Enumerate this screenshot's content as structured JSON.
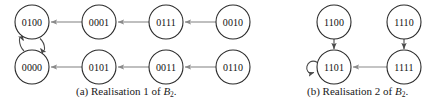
{
  "figure": {
    "background_color": "#ffffff",
    "node_stroke_color": "#2b2b2b",
    "edge_color": "#8a8a8a",
    "label_color": "#101010",
    "node_radius": 17
  },
  "panels": [
    {
      "id": "panel-a",
      "caption_prefix": "(a)",
      "caption_text": "Realisation 1 of",
      "caption_symbol": "B",
      "caption_subscript": "2",
      "caption_suffix": ".",
      "nodes": [
        {
          "id": "n0100",
          "label": "0100",
          "cx": 32,
          "cy": 22
        },
        {
          "id": "n0001",
          "label": "0001",
          "cx": 99,
          "cy": 22
        },
        {
          "id": "n0111",
          "label": "0111",
          "cx": 166,
          "cy": 22
        },
        {
          "id": "n0010",
          "label": "0010",
          "cx": 233,
          "cy": 22
        },
        {
          "id": "n0000",
          "label": "0000",
          "cx": 32,
          "cy": 67
        },
        {
          "id": "n0101",
          "label": "0101",
          "cx": 99,
          "cy": 67
        },
        {
          "id": "n0011",
          "label": "0011",
          "cx": 166,
          "cy": 67
        },
        {
          "id": "n0110",
          "label": "0110",
          "cx": 233,
          "cy": 67
        }
      ],
      "edges": [
        {
          "from": "0001",
          "to": "0100",
          "kind": "straight-left"
        },
        {
          "from": "0111",
          "to": "0001",
          "kind": "straight-left"
        },
        {
          "from": "0010",
          "to": "0111",
          "kind": "straight-left"
        },
        {
          "from": "0101",
          "to": "0000",
          "kind": "straight-left"
        },
        {
          "from": "0011",
          "to": "0101",
          "kind": "straight-left"
        },
        {
          "from": "0110",
          "to": "0011",
          "kind": "straight-left"
        },
        {
          "from": "0000",
          "to": "0100",
          "kind": "curved-up"
        },
        {
          "from": "0100",
          "to": "0000",
          "kind": "curved-down"
        }
      ]
    },
    {
      "id": "panel-b",
      "caption_prefix": "(b)",
      "caption_text": "Realisation 2 of",
      "caption_symbol": "B",
      "caption_subscript": "2",
      "caption_suffix": ".",
      "nodes": [
        {
          "id": "n1100",
          "label": "1100",
          "cx": 334,
          "cy": 22
        },
        {
          "id": "n1110",
          "label": "1110",
          "cx": 404,
          "cy": 22
        },
        {
          "id": "n1101",
          "label": "1101",
          "cx": 334,
          "cy": 67
        },
        {
          "id": "n1111",
          "label": "1111",
          "cx": 404,
          "cy": 67
        }
      ],
      "edges": [
        {
          "from": "1100",
          "to": "1101",
          "kind": "straight-down"
        },
        {
          "from": "1110",
          "to": "1111",
          "kind": "straight-down"
        },
        {
          "from": "1111",
          "to": "1101",
          "kind": "straight-left"
        },
        {
          "from": "1101",
          "to": "1101",
          "kind": "self-loop"
        }
      ]
    }
  ]
}
